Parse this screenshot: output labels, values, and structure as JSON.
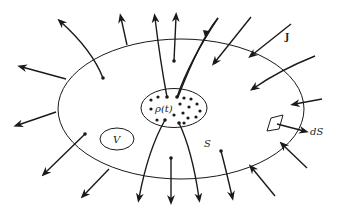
{
  "figure": {
    "labels": {
      "current_density": "J",
      "surface_element": "dS",
      "surface": "S",
      "volume": "V",
      "charge_density": "ρ(t)"
    },
    "colors": {
      "ink": "#1a1a1a",
      "background": "#ffffff"
    }
  }
}
